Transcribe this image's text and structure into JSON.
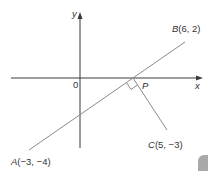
{
  "diagram": {
    "axes": {
      "x_label": "x",
      "y_label": "y",
      "origin_label": "0"
    },
    "points": {
      "A": {
        "name": "A",
        "coords": "(−3, −4)"
      },
      "B": {
        "name": "B",
        "coords": "(6, 2)"
      },
      "C": {
        "name": "C",
        "coords": "(5, −3)"
      },
      "P": {
        "name": "P"
      }
    },
    "segments": [
      {
        "from": "A",
        "to": "B"
      },
      {
        "from": "P",
        "to": "C"
      }
    ],
    "annotations": {
      "right_angle_at": "P"
    },
    "colors": {
      "axis": "#3a3a3a",
      "line": "#8a8a8a",
      "text": "#333333",
      "corner_tab": "#a9a9a9"
    }
  }
}
